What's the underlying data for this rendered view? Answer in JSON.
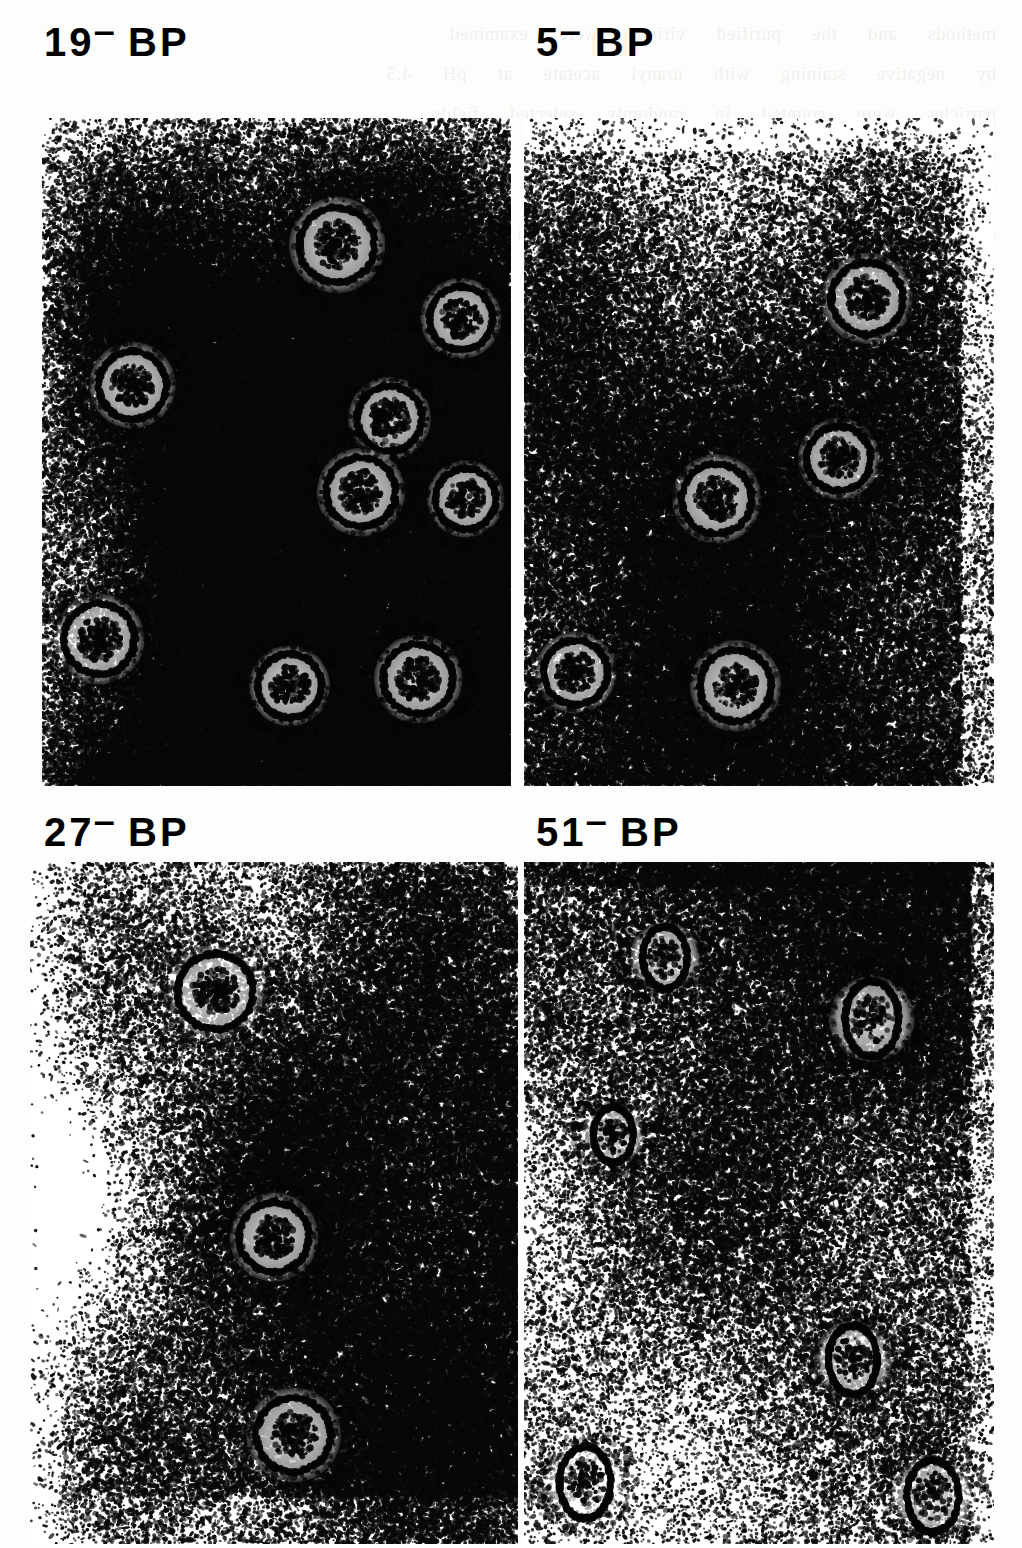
{
  "figure": {
    "type": "electron-micrograph-plate",
    "layout": "2x2 grid of negative-stain transmission electron micrographs",
    "panel_count": 4
  },
  "panels": [
    {
      "id": "panel-19-bp",
      "label_full": "19⁻ BP",
      "label_number": "19",
      "label_superscript": "−",
      "label_suffix": "BP",
      "position": "top-left",
      "grain": "dense-dark",
      "particles": [
        {
          "cx": 62,
          "cy": 19,
          "r": 5.1
        },
        {
          "cx": 19,
          "cy": 40,
          "r": 4.6
        },
        {
          "cx": 73,
          "cy": 45,
          "r": 4.4
        },
        {
          "cx": 88,
          "cy": 30,
          "r": 4.3
        },
        {
          "cx": 67,
          "cy": 56,
          "r": 4.7
        },
        {
          "cx": 89,
          "cy": 57,
          "r": 4.1
        },
        {
          "cx": 12,
          "cy": 78,
          "r": 4.8
        },
        {
          "cx": 52,
          "cy": 85,
          "r": 4.3
        },
        {
          "cx": 79,
          "cy": 84,
          "r": 4.7
        }
      ]
    },
    {
      "id": "panel-5-bp",
      "label_full": "5⁻ BP",
      "label_number": "5",
      "label_superscript": "−",
      "label_suffix": "BP",
      "position": "top-right",
      "grain": "sparse-gradient",
      "particles": [
        {
          "cx": 73,
          "cy": 27,
          "r": 4.9
        },
        {
          "cx": 67,
          "cy": 51,
          "r": 4.4
        },
        {
          "cx": 41,
          "cy": 57,
          "r": 4.8
        },
        {
          "cx": 11,
          "cy": 83,
          "r": 4.4
        },
        {
          "cx": 45,
          "cy": 85,
          "r": 4.9
        }
      ]
    },
    {
      "id": "panel-27-bp",
      "label_full": "27⁻ BP",
      "label_number": "27",
      "label_superscript": "−",
      "label_suffix": "BP",
      "position": "bottom-left",
      "grain": "medium-right-weighted",
      "particles": [
        {
          "cx": 38,
          "cy": 19,
          "r": 5.0
        },
        {
          "cx": 50,
          "cy": 55,
          "r": 4.6
        },
        {
          "cx": 54,
          "cy": 84,
          "r": 4.9
        }
      ]
    },
    {
      "id": "panel-51-bp",
      "label_full": "51⁻ BP",
      "label_number": "51",
      "label_superscript": "−",
      "label_suffix": "BP",
      "position": "bottom-right",
      "grain": "sparse-speckle",
      "particles": [
        {
          "cx": 30,
          "cy": 14,
          "r": 3.8
        },
        {
          "cx": 74,
          "cy": 23,
          "r": 4.6
        },
        {
          "cx": 19,
          "cy": 40,
          "r": 3.4
        },
        {
          "cx": 70,
          "cy": 73,
          "r": 4.2
        },
        {
          "cx": 13,
          "cy": 91,
          "r": 4.4
        },
        {
          "cx": 87,
          "cy": 93,
          "r": 4.4
        }
      ]
    }
  ],
  "ghost_text": "methods  and  the  purified  virions  were  examined\nby  negative  staining  with  uranyl  acetate  at  pH  4.5\nparticles  were  counted  in  randomly  selected  fields\nand  the  relative  proportion  of  full  and  empty  shells\nwas  determined  for  each  of  the  mutant  preparations\nshown  above.   Bar  represents  100  nm  in  all  panels.",
  "colors": {
    "paper": "#fdfdfb",
    "ink": "#000000",
    "grain": "#111111"
  }
}
